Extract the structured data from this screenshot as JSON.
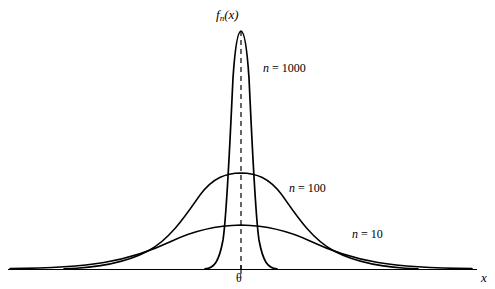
{
  "figure": {
    "background_color": "#ffffff",
    "stroke_color": "#000000",
    "width": 495,
    "height": 289
  },
  "labels": {
    "y_axis_label_base": "f",
    "y_axis_label_sub": "n",
    "y_axis_label_arg": "(x)",
    "x_axis_label": "x",
    "center_tick_label": "θ"
  },
  "chart_data": {
    "type": "line",
    "title": "",
    "xlabel": "x",
    "ylabel": "f_n(x)",
    "grid": false,
    "legend_position": "inline-right-of-curves",
    "center": "θ",
    "annotations": [
      {
        "text": "θ",
        "role": "x-axis tick label at distribution center"
      },
      {
        "text": "f_n(x)",
        "role": "density function label at peak"
      },
      {
        "text": "x",
        "role": "x-axis name at right end"
      }
    ],
    "reference_lines": [
      {
        "name": "center-dashed-line",
        "orientation": "vertical",
        "at": "θ",
        "style": "dashed",
        "from_y": 0,
        "to_y": "peak of n = 1000 curve"
      }
    ],
    "series": [
      {
        "name": "n = 1000",
        "label": "n = 1000",
        "n": 1000,
        "relative_peak_height": 1.0,
        "relative_spread": 0.17,
        "description": "tallest, narrowest normal density centered at theta"
      },
      {
        "name": "n = 100",
        "label": "n = 100",
        "n": 100,
        "relative_peak_height": 0.41,
        "relative_spread": 0.52,
        "description": "medium height and width normal density centered at theta"
      },
      {
        "name": "n = 10",
        "label": "n = 10",
        "n": 10,
        "relative_peak_height": 0.19,
        "relative_spread": 1.0,
        "description": "lowest, widest normal density centered at theta"
      }
    ],
    "xlim": [
      -1,
      1
    ],
    "ylim": [
      0,
      1.05
    ],
    "note": "Sampling distribution of an estimator concentrating about theta as n increases"
  }
}
